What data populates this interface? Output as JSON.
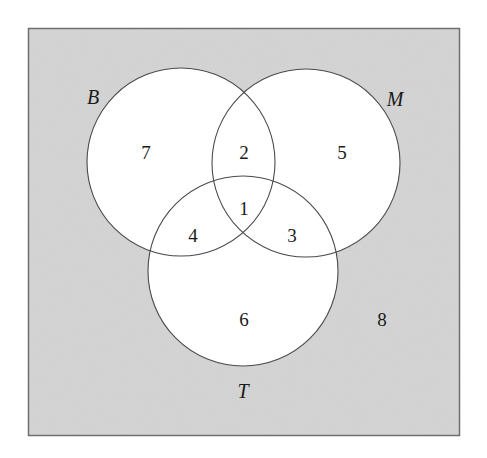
{
  "diagram": {
    "type": "venn-3-set",
    "colors": {
      "universe_fill": "#d4d4d4",
      "universe_border": "#6e6e6e",
      "circle_fill": "#ffffff",
      "circle_stroke": "#4a4a4a",
      "text": "#1a1a1a"
    },
    "sets": [
      {
        "id": "B",
        "label": "B"
      },
      {
        "id": "M",
        "label": "M"
      },
      {
        "id": "T",
        "label": "T"
      }
    ],
    "regions": {
      "B_only": "7",
      "B_and_M_only": "2",
      "M_only": "5",
      "B_and_M_and_T": "1",
      "B_and_T_only": "4",
      "M_and_T_only": "3",
      "T_only": "6",
      "outside": "8"
    }
  }
}
